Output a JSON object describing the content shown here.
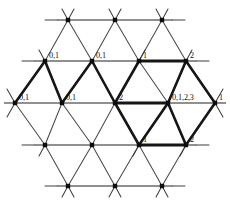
{
  "figure": {
    "type": "diagram",
    "width": 230,
    "height": 209,
    "background_color": "#ffffff",
    "thin_line_color": "#4a4a4a",
    "bold_line_color": "#161616",
    "node_color": "#0d0d0d",
    "label_color": "#111111"
  },
  "geometry": {
    "origin_x": 15,
    "origin_y": 20,
    "column_spacing": 47,
    "row_spacing": 41,
    "row_offset": 23.5,
    "stub_length": 11
  },
  "rows": [
    {
      "index": 0,
      "name": "top-row",
      "y": 20,
      "nodes": [
        {
          "id": "n0-0",
          "x": 68,
          "y": 20,
          "label": ""
        },
        {
          "id": "n0-1",
          "x": 115,
          "y": 20,
          "label": ""
        },
        {
          "id": "n0-2",
          "x": 162,
          "y": 20,
          "label": ""
        }
      ]
    },
    {
      "index": 1,
      "name": "upper-row",
      "y": 61,
      "nodes": [
        {
          "id": "n1-0",
          "x": 45,
          "y": 61,
          "label": "0,1"
        },
        {
          "id": "n1-1",
          "x": 92,
          "y": 61,
          "label": "0,1"
        },
        {
          "id": "n1-2",
          "x": 139,
          "y": 61,
          "label": "1"
        },
        {
          "id": "n1-3",
          "x": 186,
          "y": 61,
          "label": "2"
        }
      ]
    },
    {
      "index": 2,
      "name": "middle-row",
      "y": 103,
      "nodes": [
        {
          "id": "n2-0",
          "x": 15,
          "y": 103,
          "label": "0,1"
        },
        {
          "id": "n2-1",
          "x": 62,
          "y": 103,
          "label": "0,1"
        },
        {
          "id": "n2-2",
          "x": 115,
          "y": 103,
          "label": "2"
        },
        {
          "id": "n2-3",
          "x": 168,
          "y": 103,
          "label": "0,1,2,3"
        },
        {
          "id": "n2-4",
          "x": 215,
          "y": 103,
          "label": "1"
        }
      ]
    },
    {
      "index": 3,
      "name": "lower-row",
      "y": 145,
      "nodes": [
        {
          "id": "n3-0",
          "x": 45,
          "y": 145,
          "label": ""
        },
        {
          "id": "n3-1",
          "x": 92,
          "y": 145,
          "label": ""
        },
        {
          "id": "n3-2",
          "x": 139,
          "y": 145,
          "label": "1"
        },
        {
          "id": "n3-3",
          "x": 186,
          "y": 145,
          "label": "2"
        }
      ]
    },
    {
      "index": 4,
      "name": "bottom-row",
      "y": 186,
      "nodes": [
        {
          "id": "n4-0",
          "x": 68,
          "y": 186,
          "label": ""
        },
        {
          "id": "n4-1",
          "x": 115,
          "y": 186,
          "label": ""
        },
        {
          "id": "n4-2",
          "x": 162,
          "y": 186,
          "label": ""
        }
      ]
    }
  ],
  "labels": [
    {
      "text": "0,1",
      "node": "n1-0",
      "x": 49,
      "y": 58
    },
    {
      "text": "0,1",
      "node": "n1-1",
      "x": 96,
      "y": 58
    },
    {
      "text": "1",
      "node": "n1-2",
      "x": 143,
      "y": 58
    },
    {
      "text": "2",
      "node": "n1-3",
      "x": 190,
      "y": 58
    },
    {
      "text": "0,1",
      "node": "n2-0",
      "x": 19,
      "y": 100
    },
    {
      "text": "0,1",
      "node": "n2-1",
      "x": 66,
      "y": 100
    },
    {
      "text": "2",
      "node": "n2-2",
      "x": 119,
      "y": 100
    },
    {
      "text": "0,1,2,3",
      "node": "n2-3",
      "x": 172,
      "y": 100
    },
    {
      "text": "1",
      "node": "n2-4",
      "x": 219,
      "y": 100
    },
    {
      "text": "1",
      "node": "n3-2",
      "x": 143,
      "y": 142
    },
    {
      "text": "2",
      "node": "n3-3",
      "x": 190,
      "y": 142
    }
  ],
  "bold_path": {
    "description": "Heavy highlighted edges forming a connected path across the lattice",
    "segments": [
      {
        "from": "n2-1",
        "to": "n1-0"
      },
      {
        "from": "n1-0",
        "to": "n2-1"
      },
      {
        "from": "n2-1",
        "to": "n1-1"
      },
      {
        "from": "n1-1",
        "to": "n2-2"
      },
      {
        "from": "n2-2",
        "to": "n1-2"
      },
      {
        "from": "n1-2",
        "to": "n1-3"
      },
      {
        "from": "n1-3",
        "to": "n2-3"
      },
      {
        "from": "n2-3",
        "to": "n2-4"
      },
      {
        "from": "n2-4",
        "to": "n3-3"
      },
      {
        "from": "n3-3",
        "to": "n2-3"
      },
      {
        "from": "n2-3",
        "to": "n3-2"
      },
      {
        "from": "n3-2",
        "to": "n3-3"
      },
      {
        "from": "n3-2",
        "to": "n2-2"
      }
    ]
  }
}
